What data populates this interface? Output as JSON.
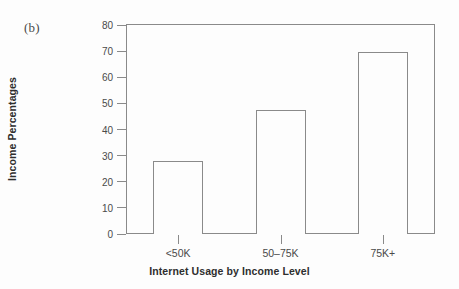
{
  "figure": {
    "panel_label": "(b)"
  },
  "chart_data": {
    "type": "bar",
    "title": "",
    "xlabel": "Internet Usage by Income Level",
    "ylabel": "Income Percentages",
    "categories": [
      "<50K",
      "50–75K",
      "75K+"
    ],
    "values": [
      28,
      47.5,
      69.7
    ],
    "ylim": [
      0,
      80
    ],
    "yticks": [
      0,
      10,
      20,
      30,
      40,
      50,
      60,
      70,
      80
    ],
    "ytick_labels": [
      "0",
      "10",
      "20",
      "30",
      "40",
      "50",
      "60",
      "70",
      "80"
    ],
    "grid": false,
    "legend": null,
    "bar_facecolor": "#fdfdfd",
    "bar_edgecolor": "#8a8a8a",
    "axis_color": "#8a8a8a",
    "text_color": "#2e2e2e",
    "tick_label_color": "#4a4a4a",
    "background": "#fdfdfd"
  }
}
